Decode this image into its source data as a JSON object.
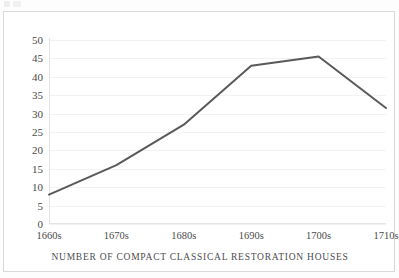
{
  "figure": {
    "caption": "NUMBER OF COMPACT CLASSICAL RESTORATION HOUSES",
    "background": "#ffffff",
    "frame_color": "#d9d9d9"
  },
  "chart_data": {
    "type": "line",
    "title": "",
    "subtitle": "",
    "xlabel": "NUMBER OF COMPACT CLASSICAL RESTORATION HOUSES",
    "ylabel": "",
    "categories": [
      "1660s",
      "1670s",
      "1680s",
      "1690s",
      "1700s",
      "1710s"
    ],
    "series": [
      {
        "name": "Compact classical restoration houses",
        "values": [
          8,
          16,
          27,
          43,
          45.5,
          31.5
        ],
        "color": "#595959",
        "line_width": 2,
        "markers": false
      }
    ],
    "x": [
      "1660s",
      "1670s",
      "1680s",
      "1690s",
      "1700s",
      "1710s"
    ],
    "ylim": [
      0,
      50
    ],
    "xlim": [
      "1660s",
      "1710s"
    ],
    "y_ticks": [
      0,
      5,
      10,
      15,
      20,
      25,
      30,
      35,
      40,
      45,
      50
    ],
    "y_tick_labels": [
      "0",
      "5",
      "10",
      "15",
      "20",
      "25",
      "30",
      "35",
      "40",
      "45",
      "50"
    ],
    "x_tick_labels": [
      "1660s",
      "1670s",
      "1680s",
      "1690s",
      "1700s",
      "1710s"
    ],
    "grid": true,
    "grid_axis": "y",
    "grid_color": "#f2f2f2",
    "legend": false,
    "legend_position": "none",
    "annotations": []
  }
}
